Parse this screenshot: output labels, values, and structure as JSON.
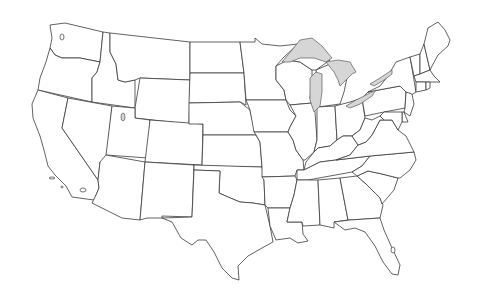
{
  "map": {
    "title": "United States outline map",
    "type": "blank state boundaries",
    "colors": {
      "background": "#ffffff",
      "state_fill": "#ffffff",
      "state_stroke": "#3a3a3a",
      "lake_fill": "#d6d6d6"
    },
    "states": [
      "WA",
      "OR",
      "CA",
      "ID",
      "NV",
      "MT",
      "WY",
      "UT",
      "AZ",
      "CO",
      "NM",
      "ND",
      "SD",
      "NE",
      "KS",
      "OK",
      "TX",
      "MN",
      "IA",
      "MO",
      "AR",
      "LA",
      "WI",
      "IL",
      "MI",
      "IN",
      "OH",
      "KY",
      "TN",
      "MS",
      "AL",
      "GA",
      "FL",
      "SC",
      "NC",
      "VA",
      "WV",
      "PA",
      "NY",
      "VT",
      "NH",
      "ME",
      "MA",
      "CT",
      "RI",
      "NJ",
      "DE",
      "MD"
    ],
    "lakes": [
      "Lake Superior",
      "Lake Michigan",
      "Lake Huron",
      "Lake Erie",
      "Lake Ontario",
      "Great Salt Lake",
      "Salton Sea",
      "Lake Okeechobee"
    ]
  }
}
